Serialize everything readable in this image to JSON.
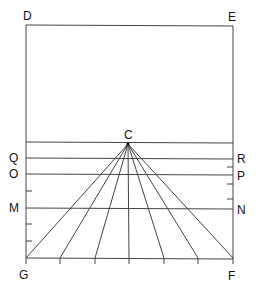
{
  "diagram": {
    "type": "perspective-construction",
    "labels": {
      "D": "D",
      "E": "E",
      "C": "C",
      "Q": "Q",
      "R": "R",
      "O": "O",
      "P": "P",
      "M": "M",
      "N": "N",
      "G": "G",
      "F": "F"
    },
    "stroke_color": "#333333",
    "background": "#ffffff"
  }
}
